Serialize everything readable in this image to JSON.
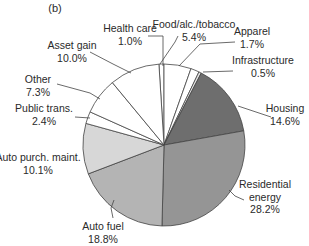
{
  "chart_data": {
    "type": "pie",
    "title": "",
    "panel_label": "(b)",
    "start_angle_deg": -3.6,
    "direction": "clockwise",
    "categories": [
      "Health care",
      "Food/alc./tobacco",
      "Apparel",
      "Infrastructure",
      "Housing",
      "Residential energy",
      "Auto fuel",
      "Auto purch. maint.",
      "Public trans.",
      "Other",
      "Asset gain"
    ],
    "values": [
      1.0,
      5.4,
      1.7,
      0.5,
      14.6,
      28.2,
      18.8,
      10.1,
      2.4,
      7.3,
      10.0
    ],
    "value_labels": [
      "1.0%",
      "5.4%",
      "1.7%",
      "0.5%",
      "14.6%",
      "28.2%",
      "18.8%",
      "10.1%",
      "2.4%",
      "7.3%",
      "10.0%"
    ],
    "colors": [
      "#ffffff",
      "#ffffff",
      "#ffffff",
      "#e6e6e6",
      "#6e6e6e",
      "#959595",
      "#b4b4b4",
      "#d7d7d7",
      "#ffffff",
      "#ffffff",
      "#ffffff"
    ],
    "units": "%",
    "legend": "none (leader-line labels)"
  },
  "labels": [
    {
      "name": "Health care",
      "lines": [
        "Health care",
        "1.0%"
      ],
      "x": 130,
      "y": 32,
      "anchor": "middle",
      "line": [
        [
          148,
          36
        ],
        [
          163,
          36
        ],
        [
          163,
          66
        ]
      ]
    },
    {
      "name": "Food/alc./tobacco",
      "lines": [
        "Food/alc./tobacco",
        "5.4%"
      ],
      "x": 194,
      "y": 28,
      "anchor": "middle",
      "line": [
        [
          160,
          64
        ],
        [
          175,
          42
        ],
        [
          178,
          36
        ]
      ]
    },
    {
      "name": "Apparel",
      "lines": [
        "Apparel",
        "1.7%"
      ],
      "x": 252,
      "y": 35,
      "anchor": "middle",
      "line": [
        [
          235,
          42
        ],
        [
          200,
          44
        ],
        [
          179,
          66
        ]
      ]
    },
    {
      "name": "Infrastructure",
      "lines": [
        "Infrastructure",
        "0.5%"
      ],
      "x": 263,
      "y": 64,
      "anchor": "middle",
      "line": [
        [
          233,
          71
        ],
        [
          203,
          72
        ]
      ]
    },
    {
      "name": "Housing",
      "lines": [
        "Housing",
        "14.6%"
      ],
      "x": 285,
      "y": 112,
      "anchor": "middle",
      "line": [
        [
          271,
          117
        ],
        [
          238,
          106
        ]
      ]
    },
    {
      "name": "Residential energy",
      "lines": [
        "Residential",
        "energy",
        "28.2%"
      ],
      "x": 265,
      "y": 188,
      "anchor": "middle",
      "line": [
        [
          244,
          200
        ],
        [
          235,
          196
        ],
        [
          229,
          190
        ]
      ]
    },
    {
      "name": "Auto fuel",
      "lines": [
        "Auto fuel",
        "18.8%"
      ],
      "x": 103,
      "y": 230,
      "anchor": "middle",
      "line": [
        [
          113,
          218
        ],
        [
          111,
          208
        ],
        [
          114,
          200
        ]
      ]
    },
    {
      "name": "Auto purch. maint.",
      "lines": [
        "Auto purch. maint.",
        "10.1%"
      ],
      "x": 38,
      "y": 161,
      "anchor": "middle",
      "line": []
    },
    {
      "name": "Public trans.",
      "lines": [
        "Public trans.",
        "2.4%"
      ],
      "x": 44,
      "y": 112,
      "anchor": "middle",
      "line": [
        [
          75,
          117
        ],
        [
          90,
          118
        ]
      ]
    },
    {
      "name": "Other",
      "lines": [
        "Other",
        "7.3%"
      ],
      "x": 38,
      "y": 83,
      "anchor": "middle",
      "line": [
        [
          57,
          84
        ],
        [
          90,
          93
        ],
        [
          100,
          99
        ]
      ]
    },
    {
      "name": "Asset gain",
      "lines": [
        "Asset gain",
        "10.0%"
      ],
      "x": 72,
      "y": 49,
      "anchor": "middle",
      "line": [
        [
          90,
          52
        ],
        [
          113,
          64
        ],
        [
          131,
          73
        ]
      ]
    }
  ],
  "geometry": {
    "cx": 164,
    "cy": 145,
    "r": 81
  },
  "stroke_color": "#444444"
}
